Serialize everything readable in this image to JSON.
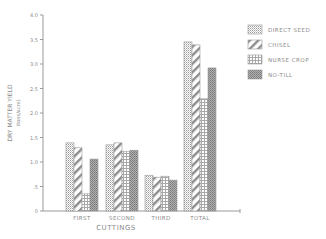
{
  "chart_data": {
    "type": "bar",
    "title": "",
    "xlabel": "CUTTINGS",
    "ylabel": "DRY MATTER YIELD",
    "ylabel_units": "(tons/acre)",
    "ylim": [
      0,
      4.0
    ],
    "yticks": [
      "0",
      ".5",
      "1.0",
      "1.5",
      "2.0",
      "2.5",
      "3.0",
      "3.5",
      "4.0"
    ],
    "ytick_values": [
      0,
      0.5,
      1.0,
      1.5,
      2.0,
      2.5,
      3.0,
      3.5,
      4.0
    ],
    "categories": [
      "FIRST",
      "SECOND",
      "THIRD",
      "TOTAL"
    ],
    "series": [
      {
        "name": "DIRECT SEED",
        "pattern": "dots",
        "values": [
          1.39,
          1.35,
          0.73,
          3.45
        ]
      },
      {
        "name": "CHISEL",
        "pattern": "diagonal",
        "values": [
          1.29,
          1.39,
          0.69,
          3.39
        ]
      },
      {
        "name": "NURSE CROP",
        "pattern": "grid",
        "values": [
          0.35,
          1.22,
          0.71,
          2.29
        ]
      },
      {
        "name": "NO-TILL",
        "pattern": "crosshatch",
        "values": [
          1.06,
          1.24,
          0.63,
          2.92
        ]
      }
    ],
    "legend_position": "upper right",
    "grid": false
  },
  "colors": {
    "axis": "#9a9a9a",
    "ink": "#8a8a8a",
    "background": "#ffffff"
  }
}
